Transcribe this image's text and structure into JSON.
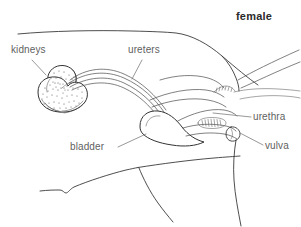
{
  "figure": {
    "title": "female",
    "background_color": "#ffffff",
    "line_color": "#3a3a3a",
    "label_color": "#5f5f5f",
    "title_color": "#2b2b2b",
    "leader_color": "#7d7d7d"
  },
  "labels": {
    "kidneys": "kidneys",
    "ureters": "ureters",
    "bladder": "bladder",
    "urethra": "urethra",
    "vulva": "vulva"
  },
  "structures": [
    {
      "name": "kidneys",
      "description": "paired stippled bean-shaped organs, upper left"
    },
    {
      "name": "ureters",
      "description": "bundle of four thin parallel tubes curving right to bladder"
    },
    {
      "name": "bladder",
      "description": "teardrop shaped sac narrowing into urethra"
    },
    {
      "name": "urethra",
      "description": "short duct from bladder neck to vulva"
    },
    {
      "name": "vulva",
      "description": "external opening at rear"
    }
  ],
  "body_outline": {
    "description": "side profile of animal showing back, rump, tail, belly and hind leg"
  }
}
